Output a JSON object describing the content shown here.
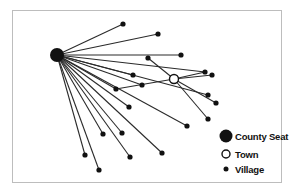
{
  "diagram": {
    "type": "central-place-network",
    "colors": {
      "line": "#2a2a2a",
      "node": "#111111",
      "frame": "#bdbdbd",
      "background": "#ffffff"
    },
    "county_seat": {
      "id": "cs",
      "x": 57,
      "y": 55,
      "r": 7
    },
    "town": {
      "id": "t",
      "x": 174,
      "y": 79,
      "r": 4.5
    },
    "villages": [
      {
        "id": "v1",
        "x": 123,
        "y": 24,
        "link": "cs"
      },
      {
        "id": "v2",
        "x": 158,
        "y": 34,
        "link": "cs"
      },
      {
        "id": "v3",
        "x": 181,
        "y": 55,
        "link": "cs"
      },
      {
        "id": "v4",
        "x": 205,
        "y": 72,
        "link": "cs"
      },
      {
        "id": "v5",
        "x": 212,
        "y": 75,
        "link": "t"
      },
      {
        "id": "v6",
        "x": 133,
        "y": 75,
        "link": "cs"
      },
      {
        "id": "v7",
        "x": 142,
        "y": 85,
        "link": "cs"
      },
      {
        "id": "v8",
        "x": 116,
        "y": 89,
        "link": "t"
      },
      {
        "id": "v9",
        "x": 148,
        "y": 58,
        "link": "t"
      },
      {
        "id": "v10",
        "x": 208,
        "y": 95,
        "link": "cs"
      },
      {
        "id": "v11",
        "x": 216,
        "y": 103,
        "link": "t"
      },
      {
        "id": "v12",
        "x": 208,
        "y": 119,
        "link": "t"
      },
      {
        "id": "v13",
        "x": 187,
        "y": 126,
        "link": "cs"
      },
      {
        "id": "v14",
        "x": 129,
        "y": 107,
        "link": "cs"
      },
      {
        "id": "v15",
        "x": 122,
        "y": 133,
        "link": "cs"
      },
      {
        "id": "v16",
        "x": 103,
        "y": 134,
        "link": "cs"
      },
      {
        "id": "v17",
        "x": 162,
        "y": 153,
        "link": "cs"
      },
      {
        "id": "v18",
        "x": 130,
        "y": 157,
        "link": "cs"
      },
      {
        "id": "v19",
        "x": 85,
        "y": 155,
        "link": "cs"
      },
      {
        "id": "v20",
        "x": 99,
        "y": 170,
        "link": "cs"
      },
      {
        "id": "v21",
        "x": 116,
        "y": 89,
        "link": "cs"
      },
      {
        "id": "v22",
        "x": 205,
        "y": 72,
        "link": "t"
      }
    ],
    "legend": {
      "items": [
        {
          "symbol": "county-seat",
          "label": "County Seat"
        },
        {
          "symbol": "town",
          "label": "Town"
        },
        {
          "symbol": "village",
          "label": "Village"
        }
      ]
    }
  }
}
